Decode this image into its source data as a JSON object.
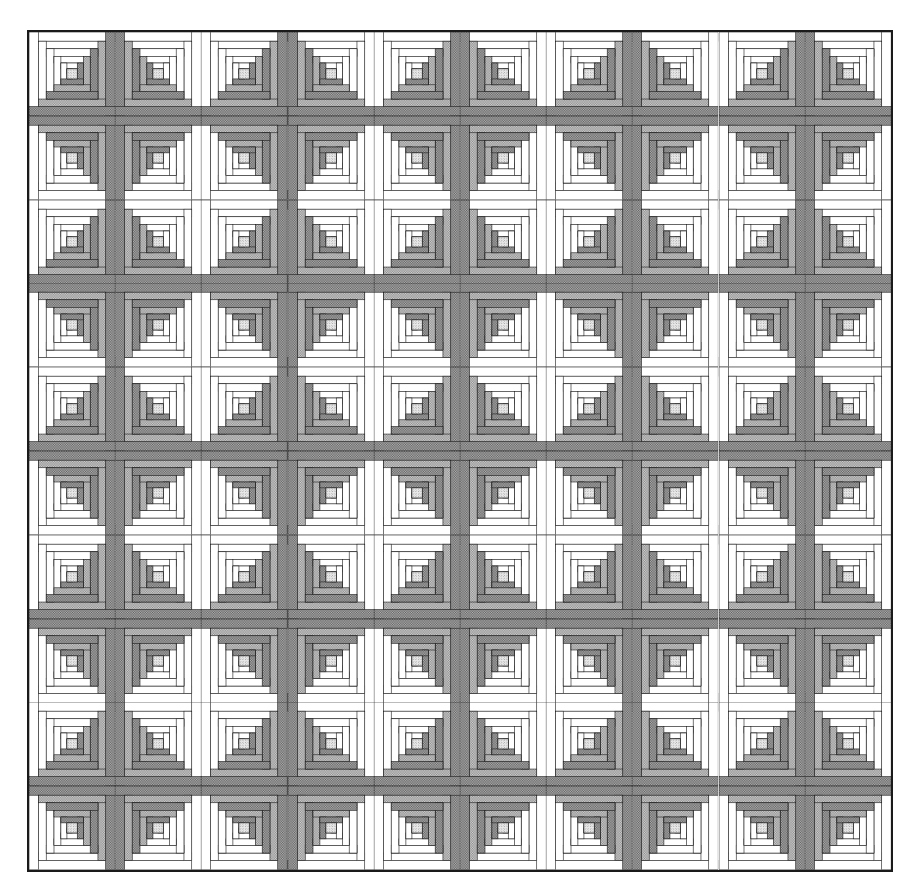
{
  "artwork": {
    "title": "Log Cabin Quilt",
    "pattern_name": "Log Cabin - Barn Raising / Mirrored Sets",
    "grid_rows": 10,
    "grid_columns": 10,
    "block_count": 100,
    "background_color": "#ffffff",
    "frame_color": "#1a1a1a",
    "frame_thickness_px": 2
  },
  "palette": {
    "light_fabric": "#ffffff",
    "light_gray_fabric": "#c9c9c9",
    "mid_gray_fabric": "#a8a8a8",
    "dark_gray_fabric": "#8f8f8f",
    "outline": "#1a1a1a",
    "center_square": "#c4c4c4"
  },
  "block": {
    "name": "log-cabin-block",
    "center_label": "center-square",
    "log_count": 7,
    "light_side": "upper-left",
    "dark_side": "lower-right",
    "logs": [
      {
        "index": 1,
        "tone": "light"
      },
      {
        "index": 2,
        "tone": "dark"
      },
      {
        "index": 3,
        "tone": "light"
      },
      {
        "index": 4,
        "tone": "dark"
      },
      {
        "index": 5,
        "tone": "light"
      },
      {
        "index": 6,
        "tone": "dark"
      },
      {
        "index": 7,
        "tone": "light"
      }
    ]
  },
  "orientation_map": {
    "description": "Per-block mirror state. 0 = base (light upper-left), h = mirrored horizontally, v = mirrored vertically, hv = rotated 180.",
    "rows": [
      [
        "0",
        "h",
        "0",
        "h",
        "0",
        "h",
        "0",
        "h",
        "0",
        "h"
      ],
      [
        "v",
        "hv",
        "v",
        "hv",
        "v",
        "hv",
        "v",
        "hv",
        "v",
        "hv"
      ],
      [
        "0",
        "h",
        "0",
        "h",
        "0",
        "h",
        "0",
        "h",
        "0",
        "h"
      ],
      [
        "v",
        "hv",
        "v",
        "hv",
        "v",
        "hv",
        "v",
        "hv",
        "v",
        "hv"
      ],
      [
        "0",
        "h",
        "0",
        "h",
        "0",
        "h",
        "0",
        "h",
        "0",
        "h"
      ],
      [
        "v",
        "hv",
        "v",
        "hv",
        "v",
        "hv",
        "v",
        "hv",
        "v",
        "hv"
      ],
      [
        "0",
        "h",
        "0",
        "h",
        "0",
        "h",
        "0",
        "h",
        "0",
        "h"
      ],
      [
        "v",
        "hv",
        "v",
        "hv",
        "v",
        "hv",
        "v",
        "hv",
        "v",
        "hv"
      ],
      [
        "0",
        "h",
        "0",
        "h",
        "0",
        "h",
        "0",
        "h",
        "0",
        "h"
      ],
      [
        "v",
        "hv",
        "v",
        "hv",
        "v",
        "hv",
        "v",
        "hv",
        "v",
        "hv"
      ]
    ]
  }
}
